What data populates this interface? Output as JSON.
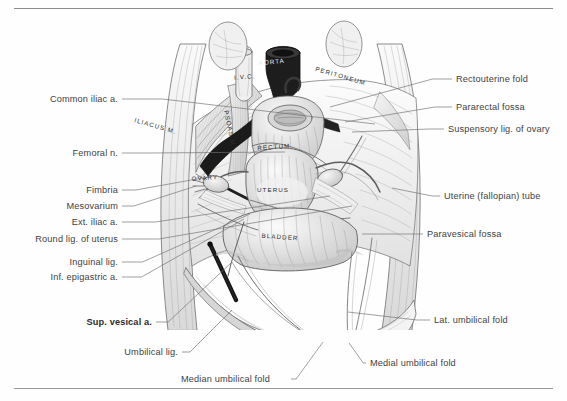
{
  "plate": {
    "title": "Female pelvis, superior view — peritoneal relations",
    "rules": {
      "top_visible": true,
      "bottom_visible": true,
      "color": "#8c8c8c"
    }
  },
  "labels_left": [
    {
      "id": "common-iliac-a",
      "text": "Common iliac a.",
      "bold": false,
      "x": 118,
      "y": 99,
      "leader_to_x": 375,
      "leader_to_y": 124
    },
    {
      "id": "femoral-n",
      "text": "Femoral n.",
      "bold": false,
      "x": 118,
      "y": 153,
      "leader_to_x": 285,
      "leader_to_y": 152
    },
    {
      "id": "fimbria",
      "text": "Fimbria",
      "bold": false,
      "x": 118,
      "y": 190,
      "leader_to_x": 208,
      "leader_to_y": 177
    },
    {
      "id": "mesovarium",
      "text": "Mesovarium",
      "bold": false,
      "x": 118,
      "y": 206,
      "leader_to_x": 196,
      "leader_to_y": 186
    },
    {
      "id": "ext-iliac-a",
      "text": "Ext. iliac a.",
      "bold": false,
      "x": 118,
      "y": 222,
      "leader_to_x": 330,
      "leader_to_y": 196
    },
    {
      "id": "round-lig-of-uterus",
      "text": "Round lig. of uterus",
      "bold": false,
      "x": 118,
      "y": 239,
      "leader_to_x": 352,
      "leader_to_y": 206
    },
    {
      "id": "inguinal-lig",
      "text": "Inguinal lig.",
      "bold": false,
      "x": 118,
      "y": 262,
      "leader_to_x": 250,
      "leader_to_y": 214
    },
    {
      "id": "inf-epigastric-a",
      "text": "Inf. epigastric a.",
      "bold": false,
      "x": 118,
      "y": 277,
      "leader_to_x": 244,
      "leader_to_y": 219
    },
    {
      "id": "sup-vesical-a",
      "text": "Sup. vesical a.",
      "bold": true,
      "x": 152,
      "y": 322,
      "leader_to_x": 232,
      "leader_to_y": 262
    },
    {
      "id": "umbilical-lig",
      "text": "Umbilical lig.",
      "bold": false,
      "x": 178,
      "y": 352,
      "leader_to_x": 232,
      "leader_to_y": 310
    },
    {
      "id": "median-umbilical-fold",
      "text": "Median umbilical fold",
      "bold": false,
      "x": 181,
      "y": 379,
      "leader_to_x": 323,
      "leader_to_y": 342,
      "align": "left"
    }
  ],
  "labels_right": [
    {
      "id": "rectouterine-fold",
      "text": "Rectouterine fold",
      "bold": false,
      "x": 456,
      "y": 79,
      "leader_to_x": 330,
      "leader_to_y": 107
    },
    {
      "id": "pararectal-fossa",
      "text": "Pararectal fossa",
      "bold": false,
      "x": 456,
      "y": 107,
      "leader_to_x": 345,
      "leader_to_y": 122
    },
    {
      "id": "suspensory-lig-ovary",
      "text": "Suspensory lig. of ovary",
      "bold": false,
      "x": 448,
      "y": 129,
      "leader_to_x": 352,
      "leader_to_y": 132
    },
    {
      "id": "uterine-fallopian-tube",
      "text": "Uterine (fallopian) tube",
      "bold": false,
      "x": 444,
      "y": 196,
      "leader_to_x": 392,
      "leader_to_y": 188
    },
    {
      "id": "paravesical-fossa",
      "text": "Paravesical fossa",
      "bold": false,
      "x": 427,
      "y": 234,
      "leader_to_x": 362,
      "leader_to_y": 234
    },
    {
      "id": "lat-umbilical-fold",
      "text": "Lat. umbilical fold",
      "bold": false,
      "x": 434,
      "y": 320,
      "leader_to_x": 348,
      "leader_to_y": 312
    },
    {
      "id": "medial-umbilical-fold",
      "text": "Medial umbilical fold",
      "bold": false,
      "x": 370,
      "y": 363,
      "leader_to_x": 349,
      "leader_to_y": 343
    }
  ],
  "engraved_labels": [
    {
      "id": "aorta",
      "text": "AORTA",
      "x": 272,
      "y": 64,
      "rotate": -6,
      "light": true
    },
    {
      "id": "ivc",
      "text": "I.V.C.",
      "x": 245,
      "y": 79,
      "rotate": -4,
      "light": false
    },
    {
      "id": "peritoneum",
      "text": "PERITONEUM",
      "x": 340,
      "y": 78,
      "rotate": 16,
      "light": false
    },
    {
      "id": "iliacus-m",
      "text": "ILIACUS M.",
      "x": 155,
      "y": 128,
      "rotate": 16,
      "light": false
    },
    {
      "id": "psoas-m",
      "text": "PSOAS M.",
      "x": 228,
      "y": 130,
      "rotate": 78,
      "light": false
    },
    {
      "id": "rectum",
      "text": "RECTUM",
      "x": 274,
      "y": 149,
      "rotate": -4,
      "light": false
    },
    {
      "id": "ovary",
      "text": "OVARY",
      "x": 205,
      "y": 180,
      "rotate": -4,
      "light": false
    },
    {
      "id": "uterus",
      "text": "UTERUS",
      "x": 273,
      "y": 192,
      "rotate": 0,
      "light": false
    },
    {
      "id": "bladder",
      "text": "BLADDER",
      "x": 280,
      "y": 239,
      "rotate": 4,
      "light": false
    }
  ],
  "colors": {
    "ink": "#3f3f3f",
    "ink_dark": "#2b2b2b",
    "rule": "#8c8c8c",
    "leader": "#6e6e6e",
    "paper": "#fefefe",
    "shade_light": "#ededed",
    "shade_mid": "#cfcfcf",
    "shade_dark": "#8f8f8f",
    "vessel_dark": "#1c1c1c"
  }
}
